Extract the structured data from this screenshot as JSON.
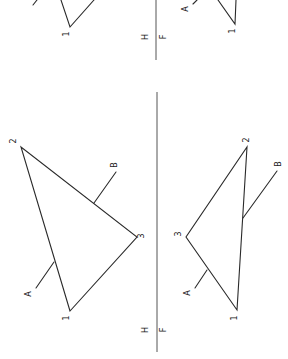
{
  "figure": {
    "colors": {
      "line": "#2a2a2a",
      "fold_line": "#555555",
      "background": "#ffffff"
    }
  },
  "top_partial": {
    "fold_labels": {
      "upper": "H",
      "lower": "F"
    },
    "left_vertex_label": "1",
    "right_vertex_label": "1",
    "right_line_label": "A"
  },
  "main": {
    "fold_labels": {
      "upper": "H",
      "lower": "F"
    },
    "left_view": {
      "vertex_labels": [
        "1",
        "2",
        "3"
      ],
      "line_labels": [
        "A",
        "B"
      ]
    },
    "right_view": {
      "vertex_labels": [
        "1",
        "2",
        "3"
      ],
      "line_labels": [
        "A",
        "B"
      ]
    }
  }
}
